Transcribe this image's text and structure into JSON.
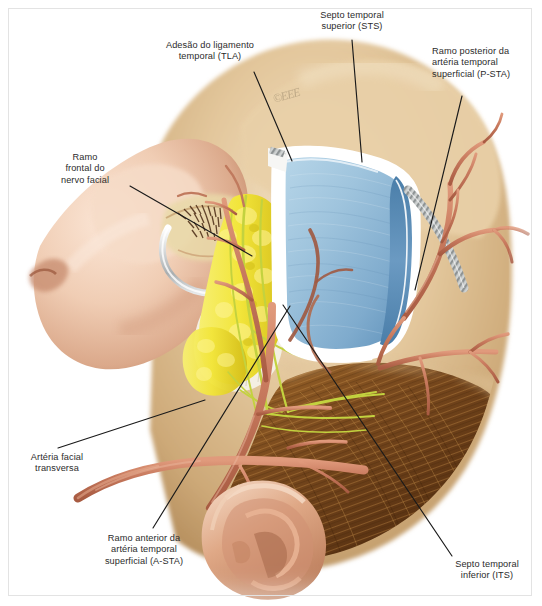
{
  "figure": {
    "kind": "medical-illustration",
    "language": "pt-BR",
    "watermark": "©EEE",
    "background_color": "#ffffff",
    "frame_color": "#e3e3e3",
    "label_color": "#2b2b2b",
    "leader_color": "#1a1a1a"
  },
  "palette": {
    "skin_light": "#f0cdb4",
    "skin_mid": "#e2ab8c",
    "skin_shadow": "#c98f72",
    "scalp_tan": "#e0c49a",
    "scalp_deep": "#c9a677",
    "hair_brown": "#7a4a1e",
    "hair_dark": "#4a2a0e",
    "fascia_blue": "#9fc4dd",
    "fascia_blue_deep": "#5d8fb8",
    "fascia_edge": "#ffffff",
    "fat_yellow": "#f2e53a",
    "fat_yellow_deep": "#d8c21c",
    "nerve_green": "#c3d23f",
    "artery_red": "#c87a5e",
    "artery_dark": "#a85b42",
    "septum_gray": "#b9bcbc",
    "retractor_silver": "#d7dadb"
  },
  "labels": [
    {
      "id": "tla",
      "name": "Adesão do ligamento temporal (TLA)",
      "text": "Adesão do ligamento\ntemporal (TLA)",
      "align": "center",
      "x": 148,
      "y": 40,
      "width": 124,
      "leader": [
        [
          254,
          72
        ],
        [
          292,
          161
        ]
      ]
    },
    {
      "id": "sts",
      "name": "Septo temporal superior (STS)",
      "text": "Septo temporal\nsuperior (STS)",
      "align": "center",
      "x": 300,
      "y": 10,
      "width": 104,
      "leader": [
        [
          352,
          40
        ],
        [
          362,
          162
        ]
      ]
    },
    {
      "id": "psta",
      "name": "Ramo posterior da artéria temporal superficial (P-STA)",
      "text": "Ramo posterior da\nartéria temporal\nsuperficial (P-STA)",
      "align": "left",
      "x": 432,
      "y": 46,
      "width": 104,
      "leader": [
        [
          462,
          96
        ],
        [
          415,
          290
        ]
      ]
    },
    {
      "id": "frontal-branch",
      "name": "Ramo frontal do nervo facial",
      "text": "Ramo\nfrontal do\nnervo facial",
      "align": "center",
      "x": 42,
      "y": 152,
      "width": 86,
      "leader": [
        [
          130,
          186
        ],
        [
          252,
          256
        ]
      ]
    },
    {
      "id": "transverse-facial-artery",
      "name": "Artéria facial transversa",
      "text": "Artéria facial\ntransversa",
      "align": "center",
      "x": 14,
      "y": 452,
      "width": 86,
      "leader": [
        [
          58,
          448
        ],
        [
          205,
          400
        ]
      ]
    },
    {
      "id": "asta",
      "name": "Ramo anterior da artéria temporal superficial (A-STA)",
      "text": "Ramo anterior da\nartéria temporal\nsuperficial (A-STA)",
      "align": "center",
      "x": 88,
      "y": 533,
      "width": 112,
      "leader": [
        [
          153,
          528
        ],
        [
          290,
          306
        ]
      ]
    },
    {
      "id": "its",
      "name": "Septo temporal inferior (ITS)",
      "text": "Septo temporal\ninferior (ITS)",
      "align": "center",
      "x": 438,
      "y": 559,
      "width": 98,
      "leader": [
        [
          452,
          556
        ],
        [
          283,
          305
        ]
      ]
    }
  ]
}
